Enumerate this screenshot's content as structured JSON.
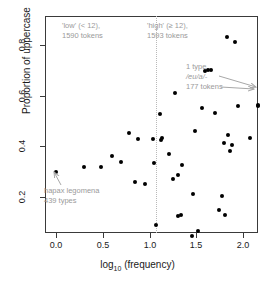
{
  "chart_data": {
    "type": "scatter",
    "title": "",
    "xlabel": "log10 (frequency)",
    "ylabel": "Proportion of uppercase",
    "xlim": [
      -0.08,
      2.22
    ],
    "ylim": [
      0.02,
      0.87
    ],
    "xticks": [
      "0.0",
      "0.5",
      "1.0",
      "1.5",
      "2.0"
    ],
    "xtick_values": [
      0.0,
      0.5,
      1.0,
      1.5,
      2.0
    ],
    "yticks": [
      "0.2",
      "0.4",
      "0.6",
      "0.8"
    ],
    "ytick_values": [
      0.2,
      0.4,
      0.6,
      0.8
    ],
    "grid": false,
    "legend": "none",
    "reference_line": {
      "x": 1.07,
      "style": "dotted",
      "color": "#b9b9b9"
    },
    "points": [
      [
        0.0,
        0.3
      ],
      [
        0.3,
        0.318
      ],
      [
        0.48,
        0.318
      ],
      [
        0.6,
        0.36
      ],
      [
        0.7,
        0.337
      ],
      [
        0.78,
        0.452
      ],
      [
        0.85,
        0.258
      ],
      [
        0.88,
        0.43
      ],
      [
        0.95,
        0.253
      ],
      [
        1.04,
        0.43
      ],
      [
        1.05,
        0.333
      ],
      [
        1.07,
        0.09
      ],
      [
        1.11,
        0.528
      ],
      [
        1.12,
        0.425
      ],
      [
        1.13,
        0.432
      ],
      [
        1.21,
        0.368
      ],
      [
        1.25,
        0.272
      ],
      [
        1.27,
        0.61
      ],
      [
        1.31,
        0.285
      ],
      [
        1.31,
        0.125
      ],
      [
        1.34,
        0.13
      ],
      [
        1.35,
        0.325
      ],
      [
        1.45,
        0.045
      ],
      [
        1.47,
        0.212
      ],
      [
        1.49,
        0.462
      ],
      [
        1.52,
        0.065
      ],
      [
        1.56,
        0.55
      ],
      [
        1.59,
        0.697
      ],
      [
        1.63,
        0.702
      ],
      [
        1.66,
        0.703
      ],
      [
        1.7,
        0.53
      ],
      [
        1.74,
        0.148
      ],
      [
        1.78,
        0.205
      ],
      [
        1.8,
        0.415
      ],
      [
        1.81,
        0.13
      ],
      [
        1.83,
        0.832
      ],
      [
        1.84,
        0.445
      ],
      [
        1.86,
        0.382
      ],
      [
        1.88,
        0.405
      ],
      [
        1.91,
        0.812
      ],
      [
        1.95,
        0.56
      ],
      [
        2.07,
        0.432
      ],
      [
        2.16,
        0.56
      ],
      [
        2.16,
        0.562
      ]
    ]
  },
  "annotations": {
    "low_group": {
      "line1": "'low' (< 12),",
      "line2": "1590 tokens"
    },
    "high_group": {
      "line1": "'high' (≥ 12),",
      "line2": "1593 tokens"
    },
    "top_type": {
      "line1": "1 type",
      "line2": "/eu/a/-",
      "line3": "177 tokens"
    },
    "hapax": {
      "line1": "hapax legomena",
      "line2": "439 types"
    }
  }
}
